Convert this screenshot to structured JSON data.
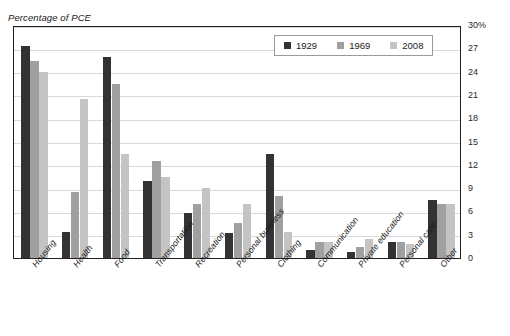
{
  "chart_data": {
    "type": "bar",
    "title": "",
    "ylabel": "Percentage of PCE",
    "xlabel": "",
    "ylim": [
      0,
      30
    ],
    "yticks": [
      "0",
      "3",
      "6",
      "9",
      "12",
      "15",
      "18",
      "21",
      "24",
      "27",
      "30%"
    ],
    "grid": true,
    "legend_position": "top-right-inside",
    "categories": [
      "Housing",
      "Health",
      "Food",
      "Transportation",
      "Recreation",
      "Personal business",
      "Clothing",
      "Communication",
      "Private education",
      "Personal care",
      "Other"
    ],
    "series": [
      {
        "name": "1929",
        "color": "#333333",
        "values": [
          27.3,
          3.4,
          25.9,
          9.9,
          5.8,
          3.2,
          13.4,
          1.0,
          0.8,
          2.1,
          7.5
        ]
      },
      {
        "name": "1969",
        "color": "#a0a0a0",
        "values": [
          25.4,
          8.5,
          22.4,
          12.5,
          7.0,
          4.5,
          8.0,
          2.0,
          1.4,
          2.1,
          7.0
        ]
      },
      {
        "name": "2008",
        "color": "#c4c4c4",
        "values": [
          23.9,
          20.5,
          13.4,
          10.4,
          9.0,
          6.9,
          3.4,
          2.0,
          2.5,
          1.8,
          7.0
        ]
      }
    ]
  },
  "legend": {
    "items": [
      {
        "label": "1929"
      },
      {
        "label": "1969"
      },
      {
        "label": "2008"
      }
    ]
  }
}
